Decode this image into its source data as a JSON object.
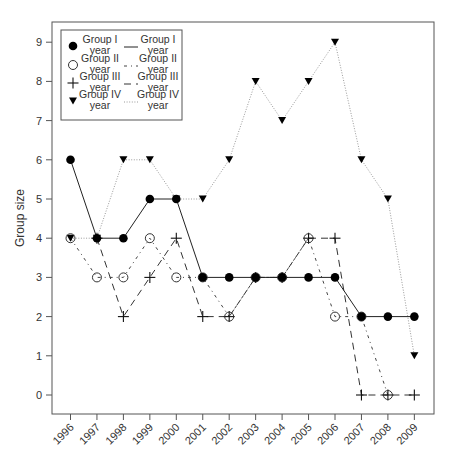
{
  "chart_data": {
    "type": "line",
    "title": "",
    "xlabel": "",
    "ylabel": "Group size",
    "x": [
      1996,
      1997,
      1998,
      1999,
      2000,
      2001,
      2002,
      2003,
      2004,
      2005,
      2006,
      2007,
      2008,
      2009
    ],
    "x_tick_labels": [
      "1996",
      "1997",
      "1998",
      "1999",
      "2000",
      "2001",
      "2002",
      "2003",
      "2004",
      "2005",
      "2006",
      "2007",
      "2008",
      "2009"
    ],
    "y_ticks": [
      0,
      1,
      2,
      3,
      4,
      5,
      6,
      7,
      8,
      9
    ],
    "y_tick_labels": [
      "0",
      "1",
      "2",
      "3",
      "4",
      "5",
      "6",
      "7",
      "8",
      "9"
    ],
    "ylim": [
      -0.5,
      9.5
    ],
    "grid": false,
    "legend_position": "upper left",
    "series": [
      {
        "name": "Group I year",
        "marker": "filled-circle",
        "line": "solid",
        "values": [
          6,
          4,
          4,
          5,
          5,
          3,
          3,
          3,
          3,
          3,
          3,
          2,
          2,
          2
        ]
      },
      {
        "name": "Group II year",
        "marker": "open-circle",
        "line": "dotdash",
        "values": [
          4,
          3,
          3,
          4,
          3,
          3,
          2,
          3,
          3,
          4,
          2,
          2,
          0,
          null
        ]
      },
      {
        "name": "Group III year",
        "marker": "plus",
        "line": "dashed",
        "values": [
          null,
          4,
          2,
          3,
          4,
          2,
          2,
          3,
          3,
          4,
          4,
          0,
          0,
          0
        ]
      },
      {
        "name": "Group IV year",
        "marker": "filled-triangle-down",
        "line": "dotted",
        "values": [
          4,
          4,
          6,
          6,
          5,
          5,
          6,
          8,
          7,
          8,
          9,
          6,
          5,
          1
        ]
      }
    ],
    "legend": {
      "marker_entries": [
        {
          "marker": "filled-circle",
          "label_line1": "Group I",
          "label_line2": "year"
        },
        {
          "marker": "open-circle",
          "label_line1": "Group II",
          "label_line2": "year"
        },
        {
          "marker": "plus",
          "label_line1": "Group III",
          "label_line2": "year"
        },
        {
          "marker": "filled-triangle-down",
          "label_line1": "Group IV",
          "label_line2": "year"
        }
      ],
      "line_entries": [
        {
          "line": "solid",
          "label_line1": "Group I",
          "label_line2": "year"
        },
        {
          "line": "dotdash",
          "label_line1": "Group II",
          "label_line2": "year"
        },
        {
          "line": "dashed",
          "label_line1": "Group III",
          "label_line2": "year"
        },
        {
          "line": "dotted",
          "label_line1": "Group IV",
          "label_line2": "year"
        }
      ]
    },
    "colors": {
      "axis": "#555555",
      "text": "#333333",
      "series": "#111111",
      "dotted": "#9a9a9a"
    }
  }
}
